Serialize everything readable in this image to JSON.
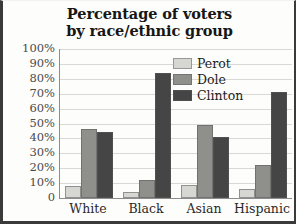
{
  "chart_data": {
    "type": "bar",
    "title": "Percentage of voters by race/ethnic group",
    "title_lines": [
      "Percentage of voters",
      "by race/ethnic group"
    ],
    "xlabel": "",
    "ylabel": "",
    "categories": [
      "White",
      "Black",
      "Asian",
      "Hispanic"
    ],
    "series": [
      {
        "name": "Perot",
        "color": "#d6d6d2",
        "values": [
          8,
          4,
          9,
          6
        ]
      },
      {
        "name": "Dole",
        "color": "#8f8f8c",
        "values": [
          46,
          12,
          49,
          22
        ]
      },
      {
        "name": "Clinton",
        "color": "#454545",
        "values": [
          44,
          84,
          41,
          71
        ]
      }
    ],
    "ylim": [
      0,
      100
    ],
    "ytick_values": [
      100,
      90,
      80,
      70,
      60,
      50,
      40,
      30,
      20,
      10,
      0
    ],
    "ytick_labels": [
      "100%",
      "90%",
      "80%",
      "70%",
      "60%",
      "50%",
      "40%",
      "30%",
      "20%",
      "10%",
      "0"
    ],
    "grid": true,
    "legend_position": "inside-top-right"
  },
  "colors": {
    "background": "#fdfdfb",
    "frame": "#3a3a3a",
    "axis": "#8d8d8d",
    "gridline": "#d8d8d4",
    "title_text": "#161616",
    "tick_text": "#4a4a4a"
  }
}
